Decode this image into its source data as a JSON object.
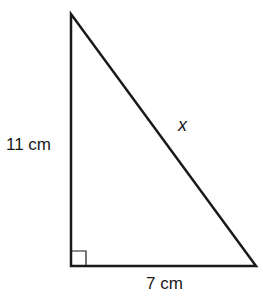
{
  "diagram": {
    "type": "right-triangle",
    "labels": {
      "height": "11 cm",
      "base": "7 cm",
      "hypotenuse": "x"
    },
    "right_angle_marker": true,
    "colors": {
      "stroke": "#1a1a1a",
      "background": "#ffffff"
    }
  }
}
